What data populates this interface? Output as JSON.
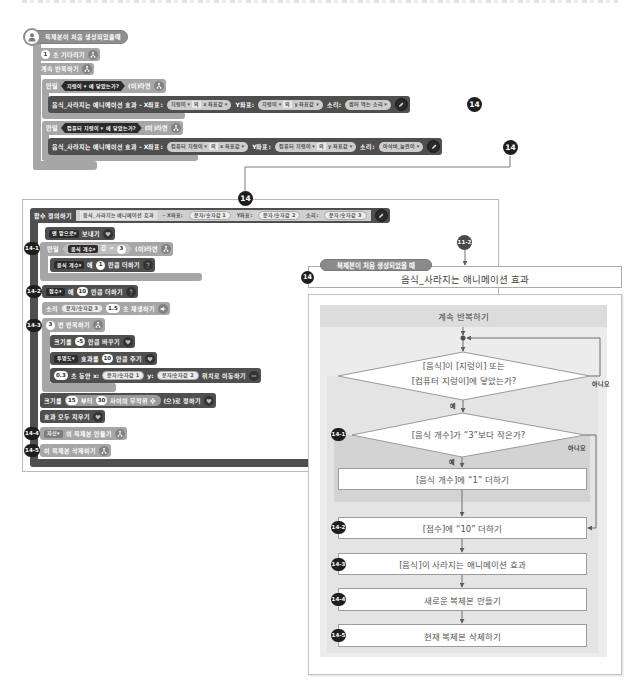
{
  "top_script": {
    "hat": {
      "label": "복제본이 처음 생성되었을때"
    },
    "wait": {
      "value": "1",
      "label": "초 기다리기"
    },
    "forever": {
      "label": "계속 반복하기"
    },
    "if1": {
      "if_label": "만일",
      "target": "지렁이",
      "touch_label": "에 닿았는가?",
      "then_label": "(이)라면",
      "call": {
        "name": "음식_사라지는 애니메이션 효과 - X좌표:",
        "x_object": "지렁이",
        "x_of": "의",
        "x_prop": "x 좌표값",
        "y_label": "Y좌표:",
        "y_object": "지렁이",
        "y_of": "의",
        "y_prop": "y 좌표값",
        "sound_label": "소리:",
        "sound": "씹어 먹는 소리"
      },
      "badge": "14"
    },
    "if2": {
      "if_label": "만일",
      "target": "컴퓨터 지렁이",
      "touch_label": "에 닿았는가?",
      "then_label": "(이)라면",
      "call": {
        "name": "음식_사라지는 애니메이션 효과 - X좌표:",
        "x_object": "컴퓨터 지렁이",
        "x_of": "의",
        "x_prop": "x 좌표값",
        "y_label": "Y좌표:",
        "y_object": "컴퓨터 지렁이",
        "y_of": "의",
        "y_prop": "y 좌표값",
        "sound_label": "소리:",
        "sound": "아삭바_놀란이"
      },
      "badge": "14"
    }
  },
  "connector": {
    "badge": "14"
  },
  "function_def": {
    "header_label": "함수 정의하기",
    "name": "음식_사라지는 애니메이션 효과",
    "x_label": "- X좌표:",
    "param1": "문자/숫자값 1",
    "y_label": "Y좌표:",
    "param2": "문자/숫자값 2",
    "sound_label": "소리:",
    "param3": "문자/숫자값 3",
    "blocks": {
      "front": {
        "option": "맨 앞으로",
        "label": "보내기"
      },
      "if_count": {
        "badge": "14-1",
        "if_label": "만일",
        "variable": "음식 개수",
        "value_label": "값",
        "operator": "<",
        "compare": "3",
        "then_label": "(이)라면"
      },
      "add_count": {
        "variable": "음식 개수",
        "to_label": "에",
        "value": "1",
        "label": "만큼 더하기"
      },
      "add_score": {
        "badge": "14-2",
        "variable": "점수",
        "to_label": "에",
        "value": "10",
        "label": "만큼 더하기"
      },
      "play_sound": {
        "prefix": "소리",
        "param": "문자/숫자값 3",
        "seconds": "1.5",
        "label": "초 재생하기"
      },
      "repeat": {
        "badge": "14-3",
        "count": "3",
        "label": "번 반복하기"
      },
      "change_size": {
        "prefix": "크기를",
        "value": "-5",
        "label": "만큼 바꾸기"
      },
      "effect": {
        "option": "투명도",
        "prefix": "효과를",
        "value": "10",
        "label": "만큼 주기"
      },
      "glide": {
        "seconds": "0.3",
        "mid": "초 동안 x:",
        "x_param": "문자/숫자값 1",
        "y_label": "y:",
        "y_param": "문자/숫자값 2",
        "label": "위치로 이동하기"
      },
      "set_size": {
        "prefix": "크기를",
        "from": "15",
        "from_label": "부터",
        "to": "30",
        "random_label": "사이의 무작위 수",
        "label": "(으)로 정하기"
      },
      "clear_effects": {
        "label": "효과 모두 지우기"
      },
      "create_clone": {
        "badge": "14-4",
        "option": "자신",
        "label": "의 복제본 만들기"
      },
      "delete_clone": {
        "badge": "14-5",
        "label": "이 복제본 삭제하기"
      }
    }
  },
  "flowchart": {
    "ref_badge": "11-2",
    "event_label": "복제본이 처음 생성되었을 때",
    "badge": "14",
    "title": "음식_사라지는 애니메이션 효과",
    "loop_label": "계속 반복하기",
    "decision1": {
      "line1": "[음식]이 [지렁이] 또는",
      "line2": "[컴퓨터 지렁이]에 닿았는가?",
      "yes": "예",
      "no": "아니요"
    },
    "decision2": {
      "badge": "14-1",
      "text": "[음식 개수]가 “3”보다 작은가?",
      "yes": "예",
      "no": "아니요"
    },
    "steps": [
      {
        "badge": "",
        "text": "[음식 개수]에 “1” 더하기"
      },
      {
        "badge": "14-2",
        "text": "[점수]에 “10” 더하기"
      },
      {
        "badge": "14-3",
        "text": "[음식]이 사라지는 애니메이션 효과"
      },
      {
        "badge": "14-4",
        "text": "새로운 복제본 만들기"
      },
      {
        "badge": "14-5",
        "text": "현재 복제본 삭제하기"
      }
    ]
  },
  "colors": {
    "flow_block": "#a6a6a6",
    "dark_block": "#4f4f4f",
    "hat_block": "#8f8f8f",
    "badge": "#1e1e1e",
    "panel": "#ececec",
    "panel_header": "#dcdcdc",
    "highlight_region": "#d3d3d3",
    "line": "#6e6e6e"
  }
}
